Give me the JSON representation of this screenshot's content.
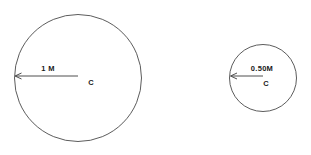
{
  "figure": {
    "background_color": "#ffffff",
    "stroke_color": "#4a4a4a",
    "text_color": "#1a1a1a"
  },
  "shapes": [
    {
      "id": "large-circle",
      "name": "large-circle",
      "center_label": "C",
      "radius_label": "1 M",
      "radius_value": 1,
      "unit": "M",
      "cx": 78,
      "cy": 78,
      "r": 64,
      "radius_arrow": {
        "from_x": 78,
        "from_y": 76,
        "to_x": 15,
        "to_y": 76,
        "direction": "left"
      },
      "label_positions": {
        "radius_label_x": 48,
        "radius_label_y": 71,
        "center_label_x": 91,
        "center_label_y": 84
      }
    },
    {
      "id": "small-circle",
      "name": "small-circle",
      "center_label": "C",
      "radius_label": "0.50M",
      "radius_value": 0.5,
      "unit": "M",
      "cx": 263,
      "cy": 78,
      "r": 34,
      "radius_arrow": {
        "from_x": 263,
        "from_y": 76,
        "to_x": 231,
        "to_y": 76,
        "direction": "left"
      },
      "label_positions": {
        "radius_label_x": 262,
        "radius_label_y": 71,
        "center_label_x": 266,
        "center_label_y": 85
      }
    }
  ],
  "labels": {
    "large_radius": "1 M",
    "large_center": "C",
    "small_radius": "0.50M",
    "small_center": "C"
  }
}
